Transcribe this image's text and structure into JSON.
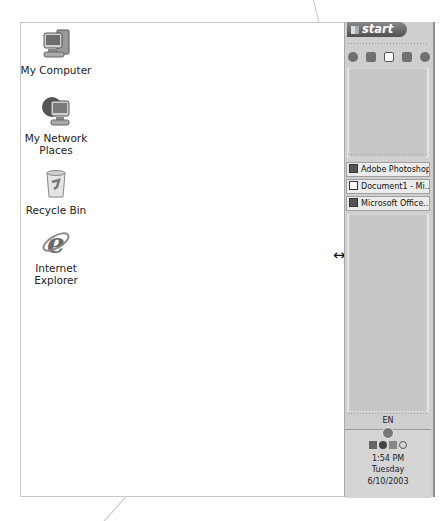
{
  "desktop": {
    "icons": [
      {
        "label_line1": "My Computer",
        "label_line2": "",
        "icon": "my-computer-icon"
      },
      {
        "label_line1": "My Network",
        "label_line2": "Places",
        "icon": "network-places-icon"
      },
      {
        "label_line1": "Recycle Bin",
        "label_line2": "",
        "icon": "recycle-bin-icon"
      },
      {
        "label_line1": "Internet",
        "label_line2": "Explorer",
        "icon": "internet-explorer-icon"
      }
    ]
  },
  "taskbar": {
    "orientation": "vertical-right",
    "start_label": "start",
    "quick_launch": [
      "ie-icon",
      "show-desktop-icon",
      "window-icon",
      "explorer-icon",
      "media-player-icon"
    ],
    "tasks": [
      {
        "label": "Adobe Photoshop",
        "icon": "photoshop-icon"
      },
      {
        "label": "Document1 - Mi...",
        "icon": "word-icon"
      },
      {
        "label": "Microsoft Office...",
        "icon": "office-icon"
      }
    ],
    "resize_cursor": "↔",
    "tray": {
      "language": "EN",
      "icons": [
        "display-icon",
        "network-globe-icon",
        "messenger-icon",
        "shield-icon"
      ],
      "time": "1:54 PM",
      "day": "Tuesday",
      "date": "6/10/2003"
    }
  }
}
